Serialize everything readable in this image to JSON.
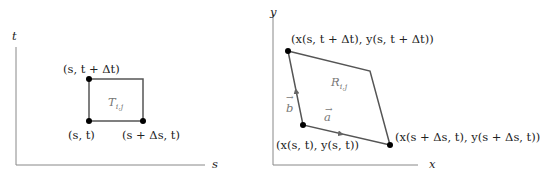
{
  "left_diagram": {
    "axis_labels": {
      "vertical": "t",
      "horizontal": "s"
    },
    "region_label": "T",
    "region_subscript": "i,j",
    "points": [
      {
        "label": "(s, t + Δt)"
      },
      {
        "label": "(s, t)"
      },
      {
        "label": "(s + Δs, t)"
      }
    ]
  },
  "right_diagram": {
    "axis_labels": {
      "vertical": "y",
      "horizontal": "x"
    },
    "region_label": "R",
    "region_subscript": "i,j",
    "vectors": {
      "a": "a",
      "b": "b"
    },
    "points": [
      {
        "label": "(x(s, t + Δt), y(s, t + Δt))"
      },
      {
        "label": "(x(s, t), y(s, t))"
      },
      {
        "label": "(x(s + Δs, t), y(s + Δs, t))"
      }
    ]
  },
  "colors": {
    "edge": "#555555",
    "axis": "#888888",
    "point": "#000000",
    "text": "#222222"
  }
}
